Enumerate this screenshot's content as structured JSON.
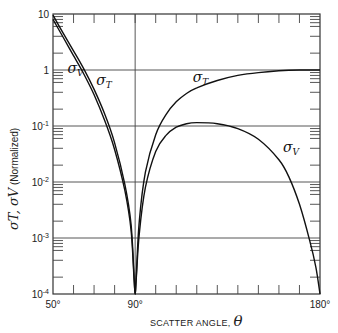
{
  "chart_data": {
    "type": "line",
    "title": "",
    "xlabel": "SCATTER ANGLE, θ",
    "ylabel": "σT, σV (Normalized)",
    "ylabel_parts": {
      "symbols": "σT, σV",
      "note": "(Normalized)"
    },
    "xlabel_parts": {
      "text": "SCATTER ANGLE,",
      "symbol": "θ"
    },
    "xscale": "linear",
    "yscale": "log",
    "xlim": [
      50,
      180
    ],
    "ylim": [
      0.0001,
      10
    ],
    "x_ticks": [
      "50°",
      "90°",
      "180°"
    ],
    "y_ticks": [
      "10",
      "1",
      "10⁻¹",
      "10⁻²",
      "10⁻³",
      "10⁻⁴"
    ],
    "grid": "horizontal at decades, vertical at 90°",
    "annotations": [
      {
        "text": "σV",
        "x": 57,
        "y": 0.9
      },
      {
        "text": "σT",
        "x": 71,
        "y": 0.55
      },
      {
        "text": "σT",
        "x": 118,
        "y": 0.6
      },
      {
        "text": "σV",
        "x": 162,
        "y": 0.035
      }
    ],
    "series": [
      {
        "name": "σT",
        "x": [
          50,
          55,
          60,
          65,
          70,
          75,
          80,
          85,
          88,
          89.5,
          90,
          90.5,
          92,
          95,
          100,
          105,
          110,
          115,
          120,
          130,
          140,
          150,
          160,
          170,
          180
        ],
        "y": [
          9.5,
          4.5,
          2.2,
          1.05,
          0.45,
          0.17,
          0.05,
          0.009,
          0.0018,
          0.0002,
          0.0001,
          0.0002,
          0.002,
          0.015,
          0.07,
          0.16,
          0.27,
          0.38,
          0.48,
          0.65,
          0.8,
          0.9,
          0.97,
          1.0,
          1.0
        ]
      },
      {
        "name": "σV",
        "x": [
          50,
          55,
          60,
          65,
          70,
          75,
          80,
          85,
          88,
          89.5,
          90,
          90.5,
          92,
          95,
          100,
          105,
          110,
          115,
          120,
          130,
          140,
          150,
          160,
          165,
          170,
          175,
          178,
          180
        ],
        "y": [
          8.0,
          3.8,
          1.8,
          0.85,
          0.36,
          0.13,
          0.038,
          0.007,
          0.0014,
          0.00018,
          0.0001,
          0.00018,
          0.0012,
          0.008,
          0.035,
          0.068,
          0.095,
          0.11,
          0.115,
          0.11,
          0.09,
          0.058,
          0.025,
          0.012,
          0.004,
          0.0009,
          0.0003,
          0.0001
        ]
      }
    ]
  }
}
